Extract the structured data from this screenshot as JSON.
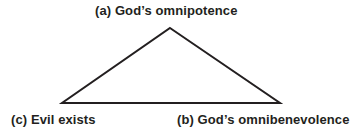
{
  "diagram": {
    "type": "triangle-diagram",
    "background_color": "#ffffff",
    "stroke_color": "#231f20",
    "text_color": "#231f20",
    "stroke_width": 2,
    "vertices": [
      {
        "id": "a",
        "name": "apex",
        "x": 170,
        "y": 28
      },
      {
        "id": "b",
        "name": "bottom-right",
        "x": 280,
        "y": 103
      },
      {
        "id": "c",
        "name": "bottom-left",
        "x": 62,
        "y": 103
      }
    ],
    "labels": {
      "apex": "(a) God’s omnipotence",
      "bottom_right": "(b) God’s omnibenevolence",
      "bottom_left": "(c) Evil exists"
    }
  }
}
